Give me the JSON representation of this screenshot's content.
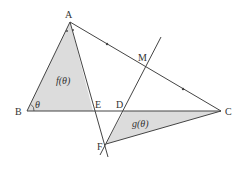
{
  "diagram": {
    "type": "geometry-figure",
    "colors": {
      "stroke": "#444444",
      "shade": "#dcdcdc",
      "text": "#333333"
    },
    "points": {
      "A": {
        "label": "A",
        "x": 70,
        "y": 22
      },
      "B": {
        "label": "B",
        "x": 27,
        "y": 111
      },
      "C": {
        "label": "C",
        "x": 221,
        "y": 111
      },
      "D": {
        "label": "D",
        "x": 124,
        "y": 111
      },
      "E": {
        "label": "E",
        "x": 93,
        "y": 111
      },
      "F": {
        "label": "F",
        "x": 106,
        "y": 144
      },
      "M": {
        "label": "M",
        "x": 145,
        "y": 67
      }
    },
    "regions": {
      "triangle_ABE": {
        "label": "f(θ)",
        "vertices": [
          "A",
          "B",
          "E"
        ]
      },
      "triangle_FDC": {
        "label": "g(θ)",
        "vertices": [
          "F",
          "D",
          "C"
        ]
      }
    },
    "angle_B": {
      "label": "θ"
    },
    "segments": [
      "AB",
      "BC",
      "AC",
      "AF",
      "FC",
      "DM-line"
    ],
    "annotations": {
      "angle_bisector_marks_at_A": "equal-angle dots",
      "equal_segment_marks_on_AC": "AM = MC tick marks"
    }
  }
}
